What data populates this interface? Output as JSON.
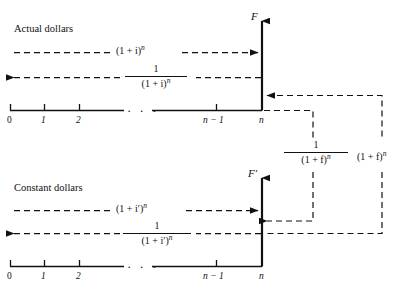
{
  "figure": {
    "title_actual": "Actual dollars",
    "title_constant": "Constant dollars",
    "background": "#ffffff",
    "ink": "#111111"
  },
  "actual_group": {
    "axis_label": "F",
    "forward_factor": {
      "base": "(1 + i)",
      "exponent": "n",
      "full": "(1 + i)^n"
    },
    "inverse_factor": {
      "numerator": "1",
      "denominator_base": "(1 + i)",
      "denominator_exponent": "n",
      "full": "1/(1 + i)^n"
    },
    "timeline_ticks": [
      {
        "label": "0",
        "italic": false
      },
      {
        "label": "1",
        "italic": true
      },
      {
        "label": "2",
        "italic": true
      },
      {
        "label": "n − 1",
        "italic": true
      },
      {
        "label": "n",
        "italic": true
      }
    ],
    "ellipsis": "· · ·"
  },
  "constant_group": {
    "axis_label": "F′",
    "forward_factor": {
      "base": "(1 + i′)",
      "exponent": "n",
      "full": "(1 + i′)^n"
    },
    "inverse_factor": {
      "numerator": "1",
      "denominator_base": "(1 + i′)",
      "denominator_exponent": "n",
      "full": "1/(1 + i′)^n"
    },
    "timeline_ticks": [
      {
        "label": "0",
        "italic": false
      },
      {
        "label": "1",
        "italic": true
      },
      {
        "label": "2",
        "italic": true
      },
      {
        "label": "n − 1",
        "italic": true
      },
      {
        "label": "n",
        "italic": true
      }
    ],
    "ellipsis": "· · ·"
  },
  "inflation_links": {
    "deflate": {
      "numerator": "1",
      "denominator_base": "(1 + f)",
      "denominator_exponent": "n",
      "full": "1/(1 + f)^n"
    },
    "inflate": {
      "base": "(1 + f)",
      "exponent": "n",
      "full": "(1 + f)^n"
    }
  }
}
